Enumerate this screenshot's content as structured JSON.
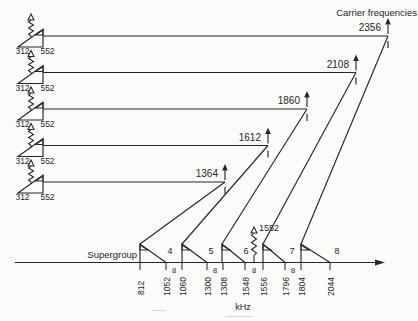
{
  "title": "Carrier frequencies",
  "colors": {
    "ink": "#262626",
    "paper": "#fcfcfa"
  },
  "input_rows": [
    {
      "low": "312",
      "high": "552",
      "carrier": "2356"
    },
    {
      "low": "312",
      "high": "552",
      "carrier": "2108"
    },
    {
      "low": "312",
      "high": "552",
      "carrier": "1860"
    },
    {
      "low": "312",
      "high": "552",
      "carrier": "1612"
    },
    {
      "low": "312",
      "high": "552",
      "carrier": "1364"
    }
  ],
  "pilot_label": "1552",
  "supergroup_section": {
    "label": "Supergroup",
    "numbers": [
      "4",
      "5",
      "6",
      "7",
      "8"
    ]
  },
  "axis": {
    "unit": "kHz",
    "ticks": [
      "812",
      "1052",
      "1060",
      "1300",
      "1308",
      "1548",
      "1556",
      "1796",
      "1804",
      "2044"
    ],
    "gap_width_label": "8"
  }
}
